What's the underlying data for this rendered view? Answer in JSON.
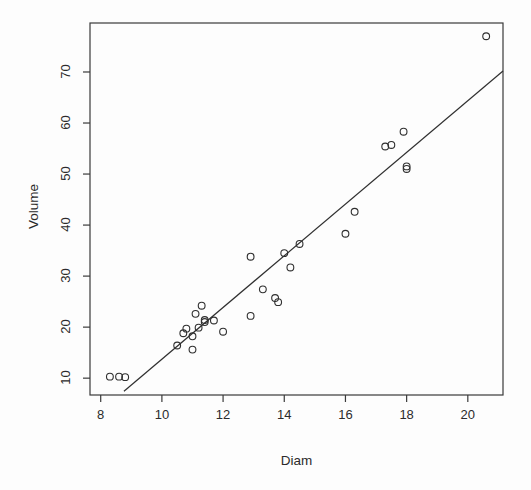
{
  "figure": {
    "background": "#fdfdfd",
    "foreground": "#3a3a3a",
    "width": 531,
    "height": 490
  },
  "chart_data": {
    "type": "scatter",
    "title": "",
    "xlabel": "Diam",
    "ylabel": "Volume",
    "xlim": [
      7.65,
      21.15
    ],
    "ylim": [
      6.7,
      79.6
    ],
    "grid": false,
    "legend": null,
    "xticks": [
      8,
      10,
      12,
      14,
      16,
      18,
      20
    ],
    "xtick_labels": [
      "8",
      "10",
      "12",
      "14",
      "16",
      "18",
      "20"
    ],
    "yticks": [
      10,
      20,
      30,
      40,
      50,
      60,
      70
    ],
    "ytick_labels": [
      "10",
      "20",
      "30",
      "40",
      "50",
      "60",
      "70"
    ],
    "marker": {
      "shape": "open-circle",
      "radius": 3.4,
      "stroke": "#2f2f2f",
      "stroke_width": 1.1,
      "fill": "none"
    },
    "x": [
      8.3,
      8.6,
      8.8,
      10.5,
      10.7,
      10.8,
      11.0,
      11.0,
      11.1,
      11.2,
      11.3,
      11.4,
      11.4,
      11.7,
      12.0,
      12.9,
      12.9,
      13.3,
      13.7,
      13.8,
      14.0,
      14.2,
      14.5,
      16.0,
      16.3,
      17.3,
      17.5,
      17.9,
      18.0,
      18.0,
      20.6
    ],
    "y": [
      10.3,
      10.3,
      10.2,
      16.4,
      18.8,
      19.7,
      15.6,
      18.2,
      22.6,
      19.9,
      24.2,
      21.0,
      21.4,
      21.3,
      19.1,
      22.2,
      33.8,
      27.4,
      25.7,
      24.9,
      34.5,
      31.7,
      36.3,
      38.3,
      42.6,
      55.4,
      55.7,
      58.3,
      51.5,
      51.0,
      77.0
    ],
    "series": [
      {
        "name": "trees",
        "points": [
          {
            "x": 8.3,
            "y": 10.3
          },
          {
            "x": 8.6,
            "y": 10.3
          },
          {
            "x": 8.8,
            "y": 10.2
          },
          {
            "x": 10.5,
            "y": 16.4
          },
          {
            "x": 10.7,
            "y": 18.8
          },
          {
            "x": 10.8,
            "y": 19.7
          },
          {
            "x": 11.0,
            "y": 15.6
          },
          {
            "x": 11.0,
            "y": 18.2
          },
          {
            "x": 11.1,
            "y": 22.6
          },
          {
            "x": 11.2,
            "y": 19.9
          },
          {
            "x": 11.3,
            "y": 24.2
          },
          {
            "x": 11.4,
            "y": 21.0
          },
          {
            "x": 11.4,
            "y": 21.4
          },
          {
            "x": 11.7,
            "y": 21.3
          },
          {
            "x": 12.0,
            "y": 19.1
          },
          {
            "x": 12.9,
            "y": 22.2
          },
          {
            "x": 12.9,
            "y": 33.8
          },
          {
            "x": 13.3,
            "y": 27.4
          },
          {
            "x": 13.7,
            "y": 25.7
          },
          {
            "x": 13.8,
            "y": 24.9
          },
          {
            "x": 14.0,
            "y": 34.5
          },
          {
            "x": 14.2,
            "y": 31.7
          },
          {
            "x": 14.5,
            "y": 36.3
          },
          {
            "x": 16.0,
            "y": 38.3
          },
          {
            "x": 16.3,
            "y": 42.6
          },
          {
            "x": 17.3,
            "y": 55.4
          },
          {
            "x": 17.5,
            "y": 55.7
          },
          {
            "x": 17.9,
            "y": 58.3
          },
          {
            "x": 18.0,
            "y": 51.5
          },
          {
            "x": 18.0,
            "y": 51.0
          },
          {
            "x": 20.6,
            "y": 77.0
          }
        ]
      }
    ],
    "fit_line": {
      "type": "linear-regression",
      "intercept": -36.94,
      "slope": 5.066,
      "stroke": "#2f2f2f",
      "stroke_width": 1.2,
      "x_start": 8.76,
      "x_end": 21.15
    }
  }
}
